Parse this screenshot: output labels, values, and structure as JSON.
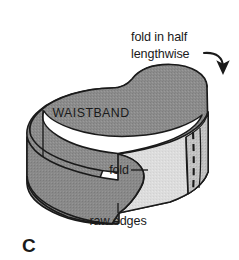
{
  "figure": {
    "panel_letter": "C",
    "caption_note": "",
    "labels": {
      "callout_line1": "fold in half",
      "callout_line2": "lengthwise",
      "waistband": "WAISTBAND",
      "fold": "fold",
      "raw_edges": "raw edges"
    },
    "icons": {
      "arrow": "curved-arrow-icon",
      "stitch": "dashed-stitch-line-icon"
    },
    "colors": {
      "background": "#ffffff",
      "band_outer_dark": "#8c8c8c",
      "band_outer_dark_alt": "#8a8a8a",
      "band_inner_light": "#d9d9d9",
      "band_inner_light_alt": "#e0e0e0",
      "seam_panel": "#bdbdbd",
      "outline": "#1a1a1a",
      "text": "#1a1a1a",
      "inside_loop": "#ffffff"
    }
  }
}
